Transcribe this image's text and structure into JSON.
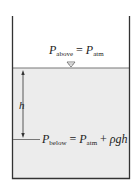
{
  "figure": {
    "colors": {
      "liquid": "#ececec",
      "wall": "#333333",
      "surface_line": "#777777",
      "text": "#222222"
    },
    "top_label": {
      "P": "P",
      "sub_left": "above",
      "equals": "=",
      "P2": "P",
      "sub_right": "atm"
    },
    "depth_label": "h",
    "bottom_label": {
      "P": "P",
      "sub_left": "below",
      "equals": "=",
      "P2": "P",
      "sub_right": "atm",
      "plus": "+",
      "rho_g_h": "ρgh"
    },
    "free_surface_symbol": "∇"
  }
}
